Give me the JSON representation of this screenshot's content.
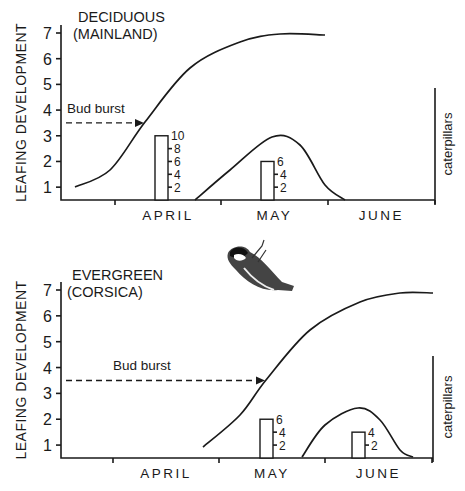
{
  "chart_data": [
    {
      "type": "line",
      "title": "DECIDUOUS (MAINLAND)",
      "title_lines": [
        "DECIDUOUS",
        "(MAINLAND)"
      ],
      "ylabel": "LEAFING DEVELOPMENT",
      "y2label": "caterpillars",
      "ylim": [
        0.5,
        7.3
      ],
      "yticks": [
        1,
        2,
        3,
        4,
        5,
        6,
        7
      ],
      "xlabel_months": [
        "APRIL",
        "MAY",
        "JUNE"
      ],
      "annotation": {
        "text": "Bud burst",
        "level": 3.5
      },
      "series": [
        {
          "name": "leafing development",
          "points": [
            [
              75,
              187
            ],
            [
              110,
              170
            ],
            [
              145,
              122
            ],
            [
              190,
              68
            ],
            [
              240,
              42
            ],
            [
              280,
              34
            ],
            [
              325,
              35
            ]
          ]
        },
        {
          "name": "caterpillar abundance",
          "points": [
            [
              195,
              200
            ],
            [
              230,
              170
            ],
            [
              272,
              137
            ],
            [
              300,
              145
            ],
            [
              325,
              185
            ],
            [
              345,
              200
            ]
          ]
        }
      ],
      "bars": [
        {
          "name": "brood size scale (April)",
          "value": 10,
          "scale_ticks": [
            2,
            4,
            6,
            8,
            10
          ],
          "x": 155,
          "w": 13
        },
        {
          "name": "brood size scale (May)",
          "value": 6,
          "scale_ticks": [
            2,
            4,
            6
          ],
          "x": 261,
          "w": 13
        }
      ],
      "geom": {
        "y0": 200,
        "ytop7": 33,
        "xaxis0": 61,
        "xaxis1": 435,
        "ticks": [
          115,
          221,
          328,
          435
        ],
        "right_axis_top": 88,
        "title_x": 78,
        "title_y": 22
      }
    },
    {
      "type": "line",
      "title": "EVERGREEN (CORSICA)",
      "title_lines": [
        "EVERGREEN",
        "(CORSICA)"
      ],
      "ylabel": "LEAFING DEVELOPMENT",
      "y2label": "caterpillars",
      "ylim": [
        0.5,
        7.3
      ],
      "yticks": [
        1,
        2,
        3,
        4,
        5,
        6,
        7
      ],
      "xlabel_months": [
        "APRIL",
        "MAY",
        "JUNE"
      ],
      "annotation": {
        "text": "Bud burst",
        "level": 3.5
      },
      "series": [
        {
          "name": "leafing development",
          "points": [
            [
              203,
              447
            ],
            [
              240,
              415
            ],
            [
              266,
              380
            ],
            [
              310,
              330
            ],
            [
              360,
              302
            ],
            [
              400,
              293
            ],
            [
              433,
              293
            ]
          ]
        },
        {
          "name": "caterpillar abundance",
          "points": [
            [
              302,
              457
            ],
            [
              325,
              425
            ],
            [
              358,
              408
            ],
            [
              380,
              420
            ],
            [
              400,
              450
            ],
            [
              413,
              457
            ]
          ]
        }
      ],
      "bars": [
        {
          "name": "brood size scale (May)",
          "value": 6,
          "scale_ticks": [
            2,
            4,
            6
          ],
          "x": 260,
          "w": 13
        },
        {
          "name": "brood size scale (June)",
          "value": 4,
          "scale_ticks": [
            2,
            4
          ],
          "x": 352,
          "w": 13
        }
      ],
      "geom": {
        "y0": 458,
        "ytop7": 290,
        "xaxis0": 61,
        "xaxis1": 433,
        "ticks": [
          113,
          219,
          325,
          432
        ],
        "right_axis_top": 356,
        "title_x": 72,
        "title_y": 280
      }
    }
  ],
  "illustration": {
    "name": "blue tit bird drawing"
  }
}
